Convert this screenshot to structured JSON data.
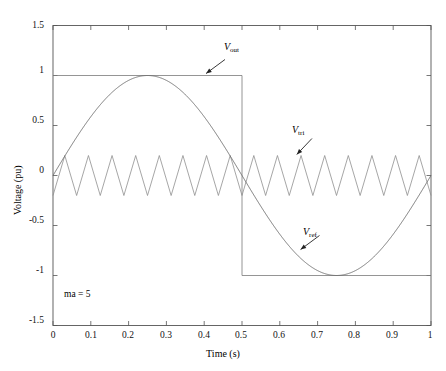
{
  "chart_data": {
    "type": "line",
    "title": "",
    "xlabel": "Time (s)",
    "ylabel": "Voltage (pu)",
    "xlim": [
      0,
      1
    ],
    "ylim": [
      -1.5,
      1.5
    ],
    "xticks": [
      0,
      0.1,
      0.2,
      0.3,
      0.4,
      0.5,
      0.6,
      0.7,
      0.8,
      0.9,
      1
    ],
    "xticklabels": [
      "0",
      "0.1",
      "0.2",
      "0.3",
      "0.4",
      "0.5",
      "0.6",
      "0.7",
      "0.8",
      "0.9",
      "1"
    ],
    "yticks": [
      -1.5,
      -1,
      -0.5,
      0,
      0.5,
      1,
      1.5
    ],
    "yticklabels": [
      "-1.5",
      "-1",
      "-0.5",
      "0",
      "0.5",
      "1",
      "1.5"
    ],
    "grid": false,
    "legend_position": "none",
    "series": [
      {
        "name": "V_ref",
        "label": "Vref",
        "description": "Sinusoidal reference, amplitude 1 pu, frequency 1 Hz, sin(2*pi*t)",
        "type": "sine",
        "amplitude": 1,
        "frequency_hz": 1,
        "phase": 0,
        "color": "#6b6b6b"
      },
      {
        "name": "V_tri",
        "label": "Vtri",
        "description": "Triangular carrier, amplitude 0.2 pu, 16 cycles per second",
        "type": "triangle",
        "amplitude": 0.2,
        "frequency_hz": 16,
        "color": "#8a8a8a"
      },
      {
        "name": "V_out",
        "label": "Vout",
        "description": "Square output, +1 pu for 0 < t < 0.5, -1 pu for 0.5 < t < 1",
        "type": "square",
        "amplitude": 1,
        "frequency_hz": 1,
        "transition_times": [
          0,
          0.5,
          1
        ],
        "levels": [
          1,
          -1
        ],
        "color": "#7a7a7a"
      }
    ],
    "annotations": [
      {
        "name": "vout-annotation",
        "text_main": "V",
        "text_sub": "out",
        "x": 0.46,
        "y": 1.22
      },
      {
        "name": "vtri-annotation",
        "text_main": "V",
        "text_sub": "tri",
        "x": 0.69,
        "y": 0.43
      },
      {
        "name": "vref-annotation",
        "text_main": "V",
        "text_sub": "ref",
        "x": 0.71,
        "y": -0.56
      },
      {
        "name": "ma-note",
        "text": "ma = 5",
        "x": 0.06,
        "y": -1.28
      }
    ]
  },
  "axes": {
    "x_title": "Time (s)",
    "y_title": "Voltage (pu)"
  },
  "note": {
    "text": "ma = 5"
  },
  "labels": {
    "vout": {
      "main": "V",
      "sub": "out"
    },
    "vtri": {
      "main": "V",
      "sub": "tri"
    },
    "vref": {
      "main": "V",
      "sub": "ref"
    }
  }
}
